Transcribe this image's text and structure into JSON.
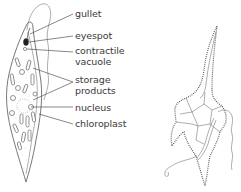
{
  "diagram": {
    "left_organism": {
      "name": "euglena",
      "labels": [
        {
          "id": "gullet",
          "lines": [
            "gullet"
          ],
          "x": 75,
          "y": 8
        },
        {
          "id": "eyespot",
          "lines": [
            "eyespot"
          ],
          "x": 75,
          "y": 30
        },
        {
          "id": "contractile-vacuole",
          "lines": [
            "contractile",
            "vacuole"
          ],
          "x": 75,
          "y": 45
        },
        {
          "id": "storage-products",
          "lines": [
            "storage",
            "products"
          ],
          "x": 75,
          "y": 74
        },
        {
          "id": "nucleus",
          "lines": [
            "nucleus"
          ],
          "x": 75,
          "y": 102
        },
        {
          "id": "chloroplast",
          "lines": [
            "chloroplast"
          ],
          "x": 75,
          "y": 118
        }
      ]
    },
    "right_organism": {
      "name": "dinoflagellate",
      "labels": []
    },
    "colors": {
      "line": "#555555",
      "text": "#3a3a3a",
      "background": "#ffffff"
    }
  }
}
